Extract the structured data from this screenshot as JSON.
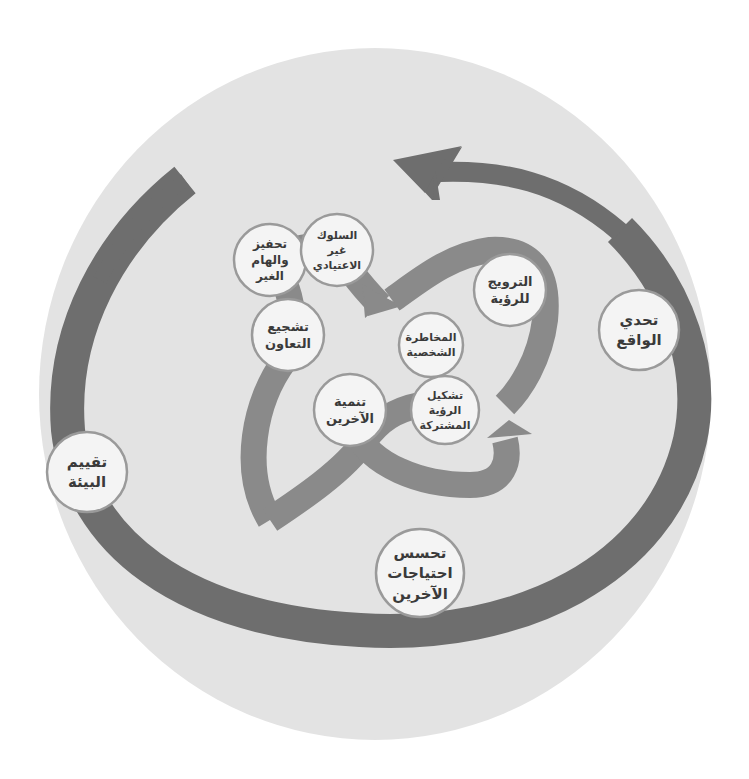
{
  "diagram": {
    "title_arc": "الايثار والمرجعيه الاخلاقيه",
    "colors": {
      "background": "#ffffff",
      "outer_disc": "#e3e3e3",
      "band_dark": "#6e6e6e",
      "band_mid": "#8a8a8a",
      "node_fill": "#f4f4f4",
      "node_stroke": "#9a9a9a",
      "text_dark": "#3a3a3a",
      "text_light": "#f1f1f1",
      "text_muted": "#8e8e8e"
    },
    "phases": [
      {
        "id": "phase-1",
        "label": "المرحلة الأولى",
        "sublabel": "البحث عن الفرص"
      },
      {
        "id": "phase-2",
        "label": "المرحلة الثانية",
        "sublabel": "الرؤية المشتركة"
      },
      {
        "id": "phase-3",
        "label": "المرحلة الثالثة",
        "sublabel": "الإبداع في تجسيد الرؤية"
      }
    ],
    "nodes": [
      {
        "id": "challenge-reality",
        "phase": "phase-1",
        "lines": [
          "تحدي",
          "الواقع"
        ]
      },
      {
        "id": "assess-environment",
        "phase": "phase-1",
        "lines": [
          "تقييم",
          "البيئة"
        ]
      },
      {
        "id": "sense-needs",
        "phase": "phase-1",
        "lines": [
          "تحسس",
          "احتياجات",
          "الآخرين"
        ]
      },
      {
        "id": "motivate-inspire",
        "phase": "phase-2",
        "lines": [
          "تحفيز",
          "والهام",
          "الغير"
        ]
      },
      {
        "id": "unconventional-behavior",
        "phase": "phase-2",
        "lines": [
          "السلوك",
          "غير",
          "الاعتيادي"
        ]
      },
      {
        "id": "encourage-cooperation",
        "phase": "phase-2",
        "lines": [
          "تشجيع",
          "التعاون"
        ]
      },
      {
        "id": "develop-others",
        "phase": "phase-2",
        "lines": [
          "تنمية",
          "الآخرين"
        ]
      },
      {
        "id": "promote-vision",
        "phase": "phase-3",
        "lines": [
          "الترويج",
          "للرؤية"
        ]
      },
      {
        "id": "personal-risk",
        "phase": "phase-3",
        "lines": [
          "المخاطرة",
          "الشخصية"
        ]
      },
      {
        "id": "shape-shared-vision",
        "phase": "phase-3",
        "lines": [
          "تشكيل",
          "الرؤية",
          "المشتركة"
        ]
      }
    ]
  }
}
